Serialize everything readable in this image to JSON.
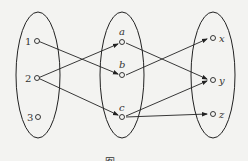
{
  "diagram": {
    "sets": [
      {
        "name": "domain",
        "elements": [
          "1",
          "2",
          "3"
        ]
      },
      {
        "name": "middle",
        "elements": [
          "a",
          "b",
          "c"
        ]
      },
      {
        "name": "codomain",
        "elements": [
          "x",
          "y",
          "z"
        ]
      }
    ],
    "labels": {
      "n1": "1",
      "n2": "2",
      "n3": "3",
      "a": "a",
      "b": "b",
      "c": "c",
      "x": "x",
      "y": "y",
      "z": "z"
    },
    "edges": [
      {
        "from": "1",
        "to": "b"
      },
      {
        "from": "2",
        "to": "a"
      },
      {
        "from": "2",
        "to": "c"
      },
      {
        "from": "a",
        "to": "y"
      },
      {
        "from": "b",
        "to": "x"
      },
      {
        "from": "c",
        "to": "y"
      },
      {
        "from": "c",
        "to": "z"
      }
    ],
    "caption": "图"
  }
}
